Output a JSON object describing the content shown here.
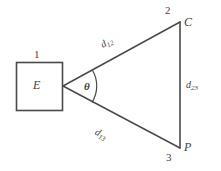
{
  "diagram": {
    "stroke_color": "#4a4a4a",
    "background_color": "#ffffff",
    "box_node": {
      "number": "1",
      "letter": "E"
    },
    "angle": {
      "symbol": "θ"
    },
    "vertices": [
      {
        "number": "2",
        "letter": "C"
      },
      {
        "number": "3",
        "letter": "P"
      }
    ],
    "edges": [
      {
        "base": "d",
        "sub": "12"
      },
      {
        "base": "d",
        "sub": "13"
      },
      {
        "base": "d",
        "sub": "23"
      }
    ]
  }
}
